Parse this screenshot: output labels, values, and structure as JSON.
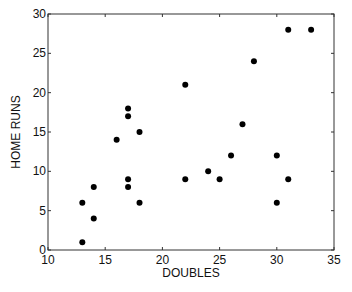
{
  "chart_data": {
    "type": "scatter",
    "title": "",
    "xlabel": "DOUBLES",
    "ylabel": "HOME RUNS",
    "xlim": [
      10,
      35
    ],
    "ylim": [
      0,
      30
    ],
    "xticks": [
      10,
      15,
      20,
      25,
      30,
      35
    ],
    "yticks": [
      0,
      5,
      10,
      15,
      20,
      25,
      30
    ],
    "grid": false,
    "legend": null,
    "marker_color": "#000000",
    "points": [
      {
        "x": 13,
        "y": 1
      },
      {
        "x": 13,
        "y": 6
      },
      {
        "x": 14,
        "y": 4
      },
      {
        "x": 14,
        "y": 8
      },
      {
        "x": 16,
        "y": 14
      },
      {
        "x": 17,
        "y": 18
      },
      {
        "x": 17,
        "y": 17
      },
      {
        "x": 17,
        "y": 9
      },
      {
        "x": 17,
        "y": 8
      },
      {
        "x": 18,
        "y": 15
      },
      {
        "x": 18,
        "y": 6
      },
      {
        "x": 22,
        "y": 21
      },
      {
        "x": 22,
        "y": 9
      },
      {
        "x": 24,
        "y": 10
      },
      {
        "x": 25,
        "y": 9
      },
      {
        "x": 26,
        "y": 12
      },
      {
        "x": 27,
        "y": 16
      },
      {
        "x": 28,
        "y": 24
      },
      {
        "x": 30,
        "y": 12
      },
      {
        "x": 30,
        "y": 6
      },
      {
        "x": 31,
        "y": 9
      },
      {
        "x": 31,
        "y": 28
      },
      {
        "x": 33,
        "y": 28
      }
    ]
  }
}
